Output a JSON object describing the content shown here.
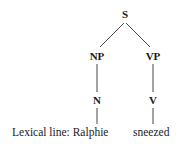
{
  "diagram": {
    "type": "syntax-tree",
    "nodes": {
      "s": "S",
      "np": "NP",
      "vp": "VP",
      "n": "N",
      "v": "V"
    },
    "lexical": {
      "label": "Lexical line: Ralphie",
      "verb": "sneezed"
    },
    "edges": [
      [
        "S",
        "NP"
      ],
      [
        "S",
        "VP"
      ],
      [
        "NP",
        "N"
      ],
      [
        "VP",
        "V"
      ],
      [
        "N",
        "Ralphie"
      ],
      [
        "V",
        "sneezed"
      ]
    ],
    "line_color": "#333333"
  }
}
